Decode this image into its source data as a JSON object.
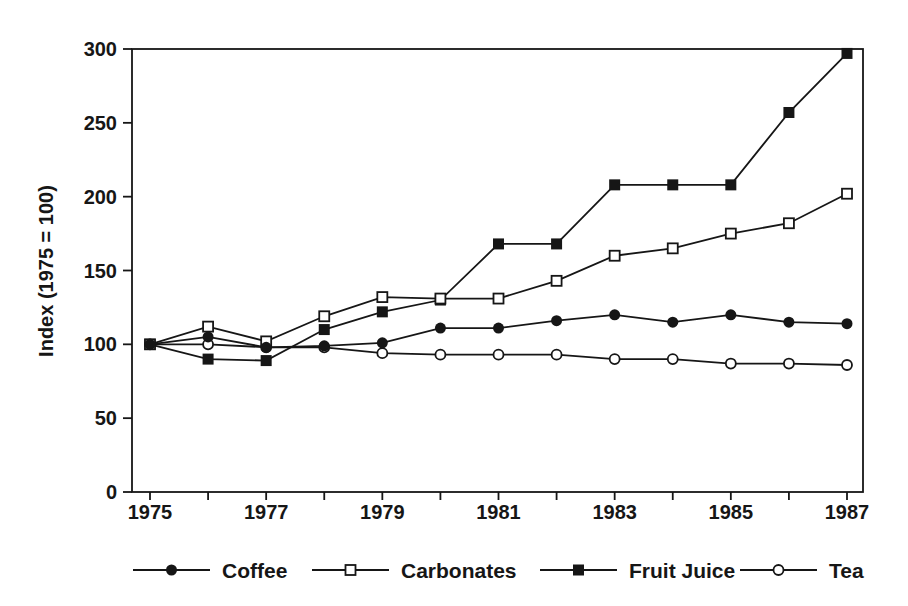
{
  "colors": {
    "ink": "#161616",
    "background": "#ffffff"
  },
  "chart_data": {
    "type": "line",
    "title": "",
    "xlabel": "",
    "ylabel": "Index (1975 = 100)",
    "ylim": [
      0,
      300
    ],
    "yticks": [
      0,
      50,
      100,
      150,
      200,
      250,
      300
    ],
    "x": [
      1975,
      1976,
      1977,
      1978,
      1979,
      1980,
      1981,
      1982,
      1983,
      1984,
      1985,
      1986,
      1987
    ],
    "xtick_labels": [
      "1975",
      "1977",
      "1979",
      "1981",
      "1983",
      "1985",
      "1987"
    ],
    "grid": false,
    "legend_position": "bottom",
    "series": [
      {
        "name": "Coffee",
        "marker": "filled-circle",
        "values": [
          100,
          105,
          98,
          99,
          101,
          111,
          111,
          116,
          120,
          115,
          120,
          115,
          114
        ]
      },
      {
        "name": "Carbonates",
        "marker": "open-square",
        "values": [
          100,
          112,
          102,
          119,
          132,
          131,
          131,
          143,
          160,
          165,
          175,
          182,
          202
        ]
      },
      {
        "name": "Fruit Juice",
        "marker": "filled-square",
        "values": [
          100,
          90,
          89,
          110,
          122,
          130,
          168,
          168,
          208,
          208,
          208,
          257,
          297
        ]
      },
      {
        "name": "Tea",
        "marker": "open-circle",
        "values": [
          100,
          100,
          98,
          98,
          94,
          93,
          93,
          93,
          90,
          90,
          87,
          87,
          86
        ]
      }
    ]
  }
}
